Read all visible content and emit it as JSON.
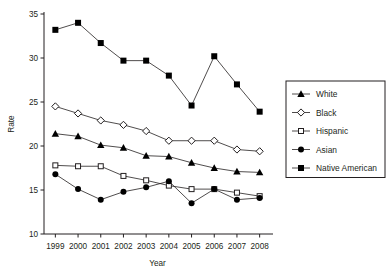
{
  "chart_data": {
    "type": "line",
    "title": "",
    "xlabel": "Year",
    "ylabel": "Rate",
    "categories": [
      "1999",
      "2000",
      "2001",
      "2002",
      "2003",
      "2004",
      "2005",
      "2006",
      "2007",
      "2008"
    ],
    "x": [
      1999,
      2000,
      2001,
      2002,
      2003,
      2004,
      2005,
      2006,
      2007,
      2008
    ],
    "xlim": [
      1998.5,
      2008.5
    ],
    "ylim": [
      10,
      35
    ],
    "yticks": [
      10,
      15,
      20,
      25,
      30,
      35
    ],
    "xticks": [
      1999,
      2000,
      2001,
      2002,
      2003,
      2004,
      2005,
      2006,
      2007,
      2008
    ],
    "grid": false,
    "legend_position": "right",
    "series": [
      {
        "name": "White",
        "marker": "filled-triangle",
        "values": [
          21.4,
          21.1,
          20.1,
          19.8,
          18.9,
          18.8,
          18.1,
          17.5,
          17.1,
          17.0
        ]
      },
      {
        "name": "Black",
        "marker": "open-diamond",
        "values": [
          24.5,
          23.7,
          22.9,
          22.4,
          21.7,
          20.6,
          20.6,
          20.6,
          19.6,
          19.4
        ]
      },
      {
        "name": "Hispanic",
        "marker": "open-square",
        "values": [
          17.8,
          17.7,
          17.7,
          16.6,
          16.1,
          15.5,
          15.1,
          15.1,
          14.7,
          14.3
        ]
      },
      {
        "name": "Asian",
        "marker": "filled-circle",
        "values": [
          16.8,
          15.1,
          13.9,
          14.8,
          15.3,
          16.0,
          13.5,
          15.1,
          13.9,
          14.1
        ]
      },
      {
        "name": "Native American",
        "marker": "filled-square",
        "values": [
          33.2,
          34.0,
          31.7,
          29.7,
          29.7,
          28.0,
          24.6,
          30.2,
          27.0,
          23.9
        ]
      }
    ]
  },
  "legend": {
    "entries": [
      {
        "label": "White"
      },
      {
        "label": "Black"
      },
      {
        "label": "Hispanic"
      },
      {
        "label": "Asian"
      },
      {
        "label": "Native American"
      }
    ]
  }
}
